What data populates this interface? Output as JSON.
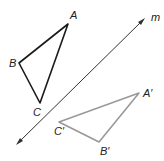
{
  "diagram": {
    "line": {
      "label": "m",
      "color": "#333333"
    },
    "original": {
      "color": "#1a1a1a",
      "vertices": [
        {
          "name": "A",
          "label": "A",
          "x": 68,
          "y": 24
        },
        {
          "name": "B",
          "label": "B",
          "x": 19,
          "y": 63
        },
        {
          "name": "C",
          "label": "C",
          "x": 40,
          "y": 103
        }
      ]
    },
    "image": {
      "color": "#999999",
      "vertices": [
        {
          "name": "A'",
          "label": "A′",
          "x": 139,
          "y": 93
        },
        {
          "name": "B'",
          "label": "B′",
          "x": 99,
          "y": 142
        },
        {
          "name": "C'",
          "label": "C′",
          "x": 59,
          "y": 122
        }
      ]
    }
  }
}
